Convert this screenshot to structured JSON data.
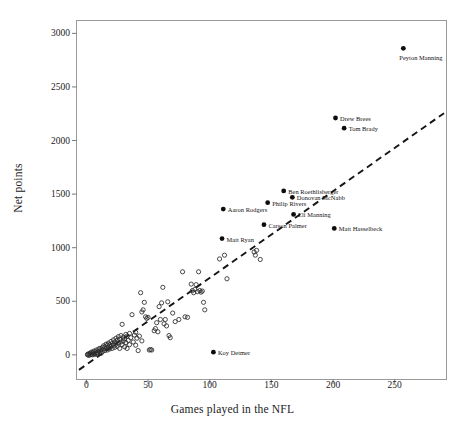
{
  "chart_data": {
    "type": "scatter",
    "title": "",
    "xlabel": "Games played in the NFL",
    "ylabel": "Net points",
    "xlim": [
      -8,
      292
    ],
    "ylim": [
      -230,
      3120
    ],
    "xticks": [
      0,
      50,
      100,
      150,
      200,
      250
    ],
    "yticks": [
      0,
      500,
      1000,
      1500,
      2000,
      2500,
      3000
    ],
    "grid": false,
    "legend": "none",
    "marker_unlabeled": "open-circle",
    "marker_labeled": "filled-circle",
    "trendline": {
      "style": "dashed",
      "x": [
        -6,
        290
      ],
      "y": [
        -140,
        2255
      ]
    },
    "labeled_points": [
      {
        "name": "Peyton Manning",
        "x": 257,
        "y": 2860,
        "label_pos": "below-right"
      },
      {
        "name": "Drew Brees",
        "x": 202,
        "y": 2210,
        "label_pos": "right"
      },
      {
        "name": "Tom Brady",
        "x": 209,
        "y": 2115,
        "label_pos": "right"
      },
      {
        "name": "Ben Roethlisberger",
        "x": 160,
        "y": 1530,
        "label_pos": "right"
      },
      {
        "name": "Donovan McNabb",
        "x": 167,
        "y": 1470,
        "label_pos": "right"
      },
      {
        "name": "Philip Rivers",
        "x": 147,
        "y": 1420,
        "label_pos": "right"
      },
      {
        "name": "Aaron Rodgers",
        "x": 111,
        "y": 1360,
        "label_pos": "right"
      },
      {
        "name": "Eli Manning",
        "x": 168,
        "y": 1310,
        "label_pos": "right"
      },
      {
        "name": "Carson Palmer",
        "x": 144,
        "y": 1215,
        "label_pos": "right"
      },
      {
        "name": "Matt Hasselbeck",
        "x": 201,
        "y": 1180,
        "label_pos": "right"
      },
      {
        "name": "Matt Ryan",
        "x": 110,
        "y": 1085,
        "label_pos": "right"
      },
      {
        "name": "Koy Detmer",
        "x": 103,
        "y": 25,
        "label_pos": "right"
      }
    ],
    "unlabeled_points": [
      {
        "x": 1,
        "y": 0
      },
      {
        "x": 1,
        "y": 5
      },
      {
        "x": 2,
        "y": -5
      },
      {
        "x": 2,
        "y": 10
      },
      {
        "x": 3,
        "y": 0
      },
      {
        "x": 3,
        "y": 15
      },
      {
        "x": 4,
        "y": 5
      },
      {
        "x": 4,
        "y": 25
      },
      {
        "x": 5,
        "y": 0
      },
      {
        "x": 5,
        "y": 20
      },
      {
        "x": 6,
        "y": 10
      },
      {
        "x": 6,
        "y": 35
      },
      {
        "x": 7,
        "y": 5
      },
      {
        "x": 7,
        "y": 30
      },
      {
        "x": 8,
        "y": 15
      },
      {
        "x": 8,
        "y": 45
      },
      {
        "x": 9,
        "y": 20
      },
      {
        "x": 9,
        "y": 5
      },
      {
        "x": 10,
        "y": 35
      },
      {
        "x": 10,
        "y": 55
      },
      {
        "x": 11,
        "y": 25
      },
      {
        "x": 11,
        "y": 60
      },
      {
        "x": 12,
        "y": 15
      },
      {
        "x": 12,
        "y": 45
      },
      {
        "x": 13,
        "y": 70
      },
      {
        "x": 13,
        "y": 30
      },
      {
        "x": 14,
        "y": 55
      },
      {
        "x": 14,
        "y": 85
      },
      {
        "x": 15,
        "y": 40
      },
      {
        "x": 15,
        "y": 75
      },
      {
        "x": 16,
        "y": 60
      },
      {
        "x": 16,
        "y": 100
      },
      {
        "x": 17,
        "y": 45
      },
      {
        "x": 17,
        "y": 90
      },
      {
        "x": 18,
        "y": 70
      },
      {
        "x": 18,
        "y": 110
      },
      {
        "x": 19,
        "y": 55
      },
      {
        "x": 19,
        "y": 95
      },
      {
        "x": 20,
        "y": 80
      },
      {
        "x": 20,
        "y": 125
      },
      {
        "x": 21,
        "y": 60
      },
      {
        "x": 21,
        "y": 105
      },
      {
        "x": 22,
        "y": 90
      },
      {
        "x": 22,
        "y": 140
      },
      {
        "x": 23,
        "y": 70
      },
      {
        "x": 23,
        "y": 120
      },
      {
        "x": 24,
        "y": 100
      },
      {
        "x": 24,
        "y": 155
      },
      {
        "x": 25,
        "y": 80
      },
      {
        "x": 25,
        "y": 135
      },
      {
        "x": 26,
        "y": 110
      },
      {
        "x": 26,
        "y": 170
      },
      {
        "x": 27,
        "y": 60
      },
      {
        "x": 27,
        "y": 145
      },
      {
        "x": 28,
        "y": 120
      },
      {
        "x": 28,
        "y": 180
      },
      {
        "x": 29,
        "y": 95
      },
      {
        "x": 29,
        "y": 285
      },
      {
        "x": 30,
        "y": 130
      },
      {
        "x": 30,
        "y": 165
      },
      {
        "x": 31,
        "y": 75
      },
      {
        "x": 31,
        "y": 150
      },
      {
        "x": 32,
        "y": 115
      },
      {
        "x": 32,
        "y": 190
      },
      {
        "x": 33,
        "y": 60
      },
      {
        "x": 33,
        "y": 175
      },
      {
        "x": 34,
        "y": 135
      },
      {
        "x": 35,
        "y": 95
      },
      {
        "x": 35,
        "y": 200
      },
      {
        "x": 36,
        "y": 160
      },
      {
        "x": 37,
        "y": 375
      },
      {
        "x": 38,
        "y": 120
      },
      {
        "x": 39,
        "y": 185
      },
      {
        "x": 40,
        "y": 90
      },
      {
        "x": 40,
        "y": 210
      },
      {
        "x": 41,
        "y": 155
      },
      {
        "x": 42,
        "y": 40
      },
      {
        "x": 43,
        "y": 175
      },
      {
        "x": 44,
        "y": 580
      },
      {
        "x": 45,
        "y": 130
      },
      {
        "x": 45,
        "y": 400
      },
      {
        "x": 46,
        "y": 420
      },
      {
        "x": 47,
        "y": 490
      },
      {
        "x": 48,
        "y": 355
      },
      {
        "x": 49,
        "y": 340
      },
      {
        "x": 50,
        "y": 350
      },
      {
        "x": 51,
        "y": 45
      },
      {
        "x": 52,
        "y": 50
      },
      {
        "x": 53,
        "y": 45
      },
      {
        "x": 55,
        "y": 225
      },
      {
        "x": 56,
        "y": 245
      },
      {
        "x": 57,
        "y": 300
      },
      {
        "x": 58,
        "y": 215
      },
      {
        "x": 59,
        "y": 450
      },
      {
        "x": 60,
        "y": 330
      },
      {
        "x": 61,
        "y": 485
      },
      {
        "x": 62,
        "y": 630
      },
      {
        "x": 63,
        "y": 290
      },
      {
        "x": 64,
        "y": 330
      },
      {
        "x": 65,
        "y": 270
      },
      {
        "x": 66,
        "y": 495
      },
      {
        "x": 67,
        "y": 180
      },
      {
        "x": 68,
        "y": 160
      },
      {
        "x": 70,
        "y": 390
      },
      {
        "x": 72,
        "y": 310
      },
      {
        "x": 75,
        "y": 330
      },
      {
        "x": 78,
        "y": 775
      },
      {
        "x": 80,
        "y": 355
      },
      {
        "x": 82,
        "y": 350
      },
      {
        "x": 85,
        "y": 660
      },
      {
        "x": 86,
        "y": 600
      },
      {
        "x": 87,
        "y": 580
      },
      {
        "x": 88,
        "y": 610
      },
      {
        "x": 89,
        "y": 655
      },
      {
        "x": 90,
        "y": 590
      },
      {
        "x": 91,
        "y": 775
      },
      {
        "x": 92,
        "y": 600
      },
      {
        "x": 93,
        "y": 585
      },
      {
        "x": 94,
        "y": 595
      },
      {
        "x": 95,
        "y": 490
      },
      {
        "x": 96,
        "y": 420
      },
      {
        "x": 108,
        "y": 895
      },
      {
        "x": 112,
        "y": 930
      },
      {
        "x": 114,
        "y": 710
      },
      {
        "x": 136,
        "y": 960
      },
      {
        "x": 137,
        "y": 930
      },
      {
        "x": 138,
        "y": 975
      },
      {
        "x": 141,
        "y": 890
      }
    ]
  }
}
